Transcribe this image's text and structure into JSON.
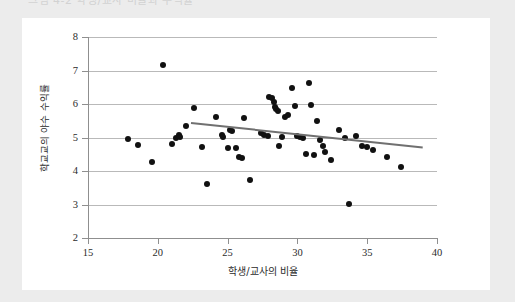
{
  "page": {
    "background_color": "#ececec",
    "card_background": "#ffffff",
    "cutoff_header_text": "그림 4-2   학생/교사 비율과 수익률"
  },
  "chart_data": {
    "type": "scatter",
    "title": "",
    "xlabel": "학생/교사의 비율",
    "ylabel": "학교교의 야수 수익률",
    "xlim": [
      15,
      40
    ],
    "ylim": [
      2,
      8
    ],
    "xticks": [
      15,
      20,
      25,
      30,
      35,
      40
    ],
    "yticks": [
      2,
      3,
      4,
      5,
      6,
      7,
      8
    ],
    "grid": "horizontal",
    "legend": "none",
    "marker_color": "#111111",
    "trendline_color": "#707070",
    "points": [
      [
        17.9,
        4.95
      ],
      [
        18.6,
        4.78
      ],
      [
        19.6,
        4.28
      ],
      [
        20.4,
        7.15
      ],
      [
        21.0,
        4.82
      ],
      [
        21.3,
        4.98
      ],
      [
        21.5,
        5.08
      ],
      [
        21.6,
        5.02
      ],
      [
        22.0,
        5.35
      ],
      [
        22.6,
        5.88
      ],
      [
        23.2,
        4.72
      ],
      [
        23.5,
        3.62
      ],
      [
        24.2,
        5.62
      ],
      [
        24.6,
        5.08
      ],
      [
        24.7,
        5.02
      ],
      [
        25.0,
        4.68
      ],
      [
        25.2,
        5.22
      ],
      [
        25.3,
        5.18
      ],
      [
        25.6,
        4.68
      ],
      [
        25.8,
        4.42
      ],
      [
        26.0,
        4.38
      ],
      [
        26.2,
        5.58
      ],
      [
        26.6,
        3.72
      ],
      [
        27.4,
        5.12
      ],
      [
        27.6,
        5.08
      ],
      [
        27.9,
        5.05
      ],
      [
        28.0,
        6.22
      ],
      [
        28.2,
        6.18
      ],
      [
        28.3,
        6.05
      ],
      [
        28.4,
        5.92
      ],
      [
        28.5,
        5.85
      ],
      [
        28.6,
        5.78
      ],
      [
        28.7,
        4.75
      ],
      [
        28.9,
        5.02
      ],
      [
        29.1,
        5.62
      ],
      [
        29.3,
        5.68
      ],
      [
        29.6,
        6.48
      ],
      [
        29.8,
        5.95
      ],
      [
        30.0,
        5.05
      ],
      [
        30.2,
        5.02
      ],
      [
        30.4,
        4.98
      ],
      [
        30.6,
        4.52
      ],
      [
        30.8,
        6.62
      ],
      [
        31.0,
        5.98
      ],
      [
        31.2,
        4.48
      ],
      [
        31.4,
        5.48
      ],
      [
        31.6,
        4.92
      ],
      [
        31.8,
        4.75
      ],
      [
        32.0,
        4.58
      ],
      [
        32.4,
        4.32
      ],
      [
        33.0,
        5.22
      ],
      [
        33.4,
        4.98
      ],
      [
        33.7,
        3.02
      ],
      [
        34.2,
        5.05
      ],
      [
        34.6,
        4.75
      ],
      [
        35.0,
        4.72
      ],
      [
        35.4,
        4.62
      ],
      [
        36.4,
        4.42
      ],
      [
        37.4,
        4.12
      ]
    ],
    "trendline": {
      "x_start": 22.4,
      "y_start": 5.45,
      "x_end": 39.0,
      "y_end": 4.72
    }
  }
}
